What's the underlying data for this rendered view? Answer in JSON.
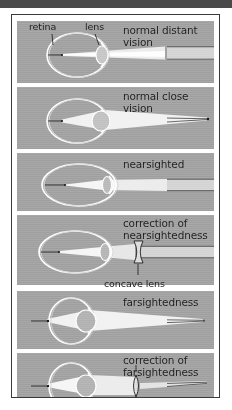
{
  "figure": {
    "background_color": "#a5a5a5",
    "frame_border_color": "#3a3a3a",
    "topbar_color": "#4a4a4a",
    "ray_color": "#ffffff",
    "outline_color": "#ffffff",
    "text_color": "#1d1d1d"
  },
  "callouts": {
    "retina": "retina",
    "lens": "lens",
    "concave_lens": "concave lens",
    "convex_lens": "convex lens"
  },
  "panels": [
    {
      "id": "normal-distant-vision",
      "label": "normal distant\nvision",
      "eye_type": "normal",
      "has_correction_lens": false
    },
    {
      "id": "normal-close-vision",
      "label": "normal close\nvision",
      "eye_type": "normal",
      "has_correction_lens": false
    },
    {
      "id": "nearsighted",
      "label": "nearsighted",
      "eye_type": "elongated",
      "has_correction_lens": false
    },
    {
      "id": "correction-of-nearsightedness",
      "label": "correction of\nnearsightedness",
      "eye_type": "elongated",
      "has_correction_lens": true,
      "correction_lens": "concave"
    },
    {
      "id": "farsightedness",
      "label": "farsightedness",
      "eye_type": "flattened",
      "has_correction_lens": false
    },
    {
      "id": "correction-of-farsightedness",
      "label": "correction of\nfarsightedness",
      "eye_type": "flattened",
      "has_correction_lens": true,
      "correction_lens": "convex"
    }
  ]
}
